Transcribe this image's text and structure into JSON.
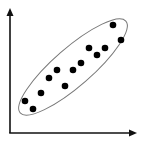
{
  "chart_data": {
    "type": "scatter",
    "title": "",
    "xlabel": "",
    "ylabel": "",
    "grid": false,
    "legend": null,
    "annotations": [
      "ellipse enclosing all points (positive correlation cluster)"
    ],
    "points": [
      {
        "x": 25,
        "y": 101
      },
      {
        "x": 33,
        "y": 109
      },
      {
        "x": 41,
        "y": 93
      },
      {
        "x": 49,
        "y": 78
      },
      {
        "x": 57,
        "y": 70
      },
      {
        "x": 65,
        "y": 86
      },
      {
        "x": 73,
        "y": 70
      },
      {
        "x": 81,
        "y": 63
      },
      {
        "x": 89,
        "y": 48
      },
      {
        "x": 97,
        "y": 55
      },
      {
        "x": 105,
        "y": 48
      },
      {
        "x": 113,
        "y": 25
      },
      {
        "x": 121,
        "y": 40
      }
    ]
  },
  "style": {
    "axis_color": "#111111",
    "dot_color": "#000000",
    "ellipse_color": "#777777"
  }
}
